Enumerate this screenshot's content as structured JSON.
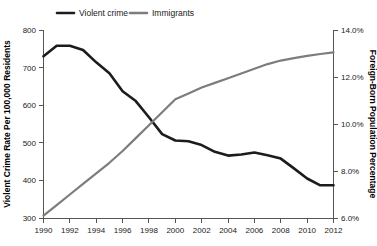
{
  "chart_data": {
    "type": "line",
    "title": "",
    "xlabel": "",
    "ylabel": "Violent Crime Rate Per 100,000 Residents",
    "y2label": "Foreign-Born Population Percentage",
    "grid": false,
    "legend_position": "top",
    "x": [
      1990,
      1991,
      1992,
      1993,
      1994,
      1995,
      1996,
      1997,
      1998,
      1999,
      2000,
      2001,
      2002,
      2003,
      2004,
      2005,
      2006,
      2007,
      2008,
      2009,
      2010,
      2011,
      2012
    ],
    "xlim": [
      1990,
      2012
    ],
    "xticks": [
      1990,
      1992,
      1994,
      1996,
      1998,
      2000,
      2002,
      2004,
      2006,
      2008,
      2010,
      2012
    ],
    "xtick_labels": [
      "1990",
      "1992",
      "1994",
      "1996",
      "1998",
      "2000",
      "2002",
      "2004",
      "2006",
      "2008",
      "2010",
      "2012"
    ],
    "ylim": [
      300,
      800
    ],
    "yticks": [
      300,
      400,
      500,
      600,
      700,
      800
    ],
    "ytick_labels": [
      "300",
      "400",
      "500",
      "600",
      "700",
      "800"
    ],
    "y2lim": [
      6.0,
      14.0
    ],
    "y2ticks": [
      6.0,
      8.0,
      10.0,
      12.0,
      14.0
    ],
    "y2tick_labels": [
      "6.0%",
      "8.0%",
      "10.0%",
      "12.0%",
      "14.0%"
    ],
    "series": [
      {
        "name": "Violent crime",
        "axis": "left",
        "color": "#1c1c1c",
        "values": [
          730,
          758,
          758,
          747,
          714,
          685,
          637,
          611,
          568,
          523,
          506,
          504,
          494,
          476,
          466,
          469,
          474,
          467,
          458,
          432,
          405,
          387,
          387
        ]
      },
      {
        "name": "Immigrants",
        "axis": "right",
        "color": "#7d7d7d",
        "values": [
          6.1,
          6.55,
          7.0,
          7.45,
          7.9,
          8.35,
          8.85,
          9.4,
          9.95,
          10.5,
          11.05,
          11.3,
          11.55,
          11.75,
          11.95,
          12.15,
          12.35,
          12.55,
          12.7,
          12.8,
          12.9,
          12.98,
          13.05
        ]
      }
    ],
    "legend": [
      {
        "label": "Violent crime",
        "color": "#1c1c1c"
      },
      {
        "label": "Immigrants",
        "color": "#7d7d7d"
      }
    ]
  }
}
